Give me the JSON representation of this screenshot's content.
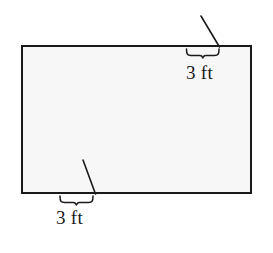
{
  "figure": {
    "type": "geometry-diagram",
    "colors": {
      "background": "#ffffff",
      "shape_fill": "#f7f7f7",
      "stroke": "#1a1a1a",
      "label_text": "#1a1a1a"
    },
    "rectangle": {
      "name": "main-rectangle",
      "x": 22,
      "y": 46,
      "width": 229,
      "height": 147,
      "stroke_width": 2
    },
    "annotations": [
      {
        "id": "top-right-dimension",
        "label": "3 ft",
        "brace": {
          "x1": 186,
          "x2": 219,
          "y": 49,
          "depth": 7
        },
        "leader": {
          "x1": 201,
          "y1": 16,
          "x2": 219,
          "y2": 47
        },
        "label_position": {
          "left": 186,
          "top": 63
        }
      },
      {
        "id": "bottom-left-dimension",
        "label": "3 ft",
        "brace": {
          "x1": 60,
          "x2": 95,
          "y": 196,
          "depth": 7
        },
        "leader": {
          "x1": 83,
          "y1": 160,
          "x2": 95,
          "y2": 194
        },
        "label_position": {
          "left": 56,
          "top": 208
        }
      }
    ]
  },
  "labels": {
    "top_dimension": "3 ft",
    "bottom_dimension": "3 ft"
  }
}
